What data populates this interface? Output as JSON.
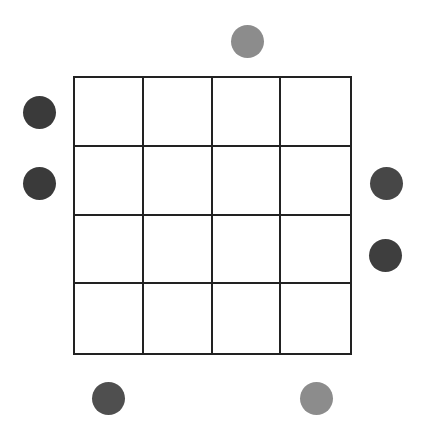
{
  "puzzle": {
    "grid": {
      "rows": 4,
      "cols": 4,
      "left": 73,
      "top": 76,
      "size": 279,
      "line_color": "#222222"
    },
    "clues": [
      {
        "side": "top",
        "index": 2,
        "cx": 247,
        "cy": 41,
        "d": 33,
        "color": "#8c8c8c"
      },
      {
        "side": "left",
        "index": 0,
        "cx": 39,
        "cy": 112,
        "d": 33,
        "color": "#3a3a3a"
      },
      {
        "side": "left",
        "index": 1,
        "cx": 39,
        "cy": 183,
        "d": 33,
        "color": "#3a3a3a"
      },
      {
        "side": "right",
        "index": 1,
        "cx": 386,
        "cy": 183,
        "d": 33,
        "color": "#474747"
      },
      {
        "side": "right",
        "index": 2,
        "cx": 385,
        "cy": 255,
        "d": 33,
        "color": "#3e3e3e"
      },
      {
        "side": "bottom",
        "index": 0,
        "cx": 108,
        "cy": 398,
        "d": 33,
        "color": "#4f4f4f"
      },
      {
        "side": "bottom",
        "index": 3,
        "cx": 316,
        "cy": 398,
        "d": 33,
        "color": "#8c8c8c"
      }
    ]
  }
}
